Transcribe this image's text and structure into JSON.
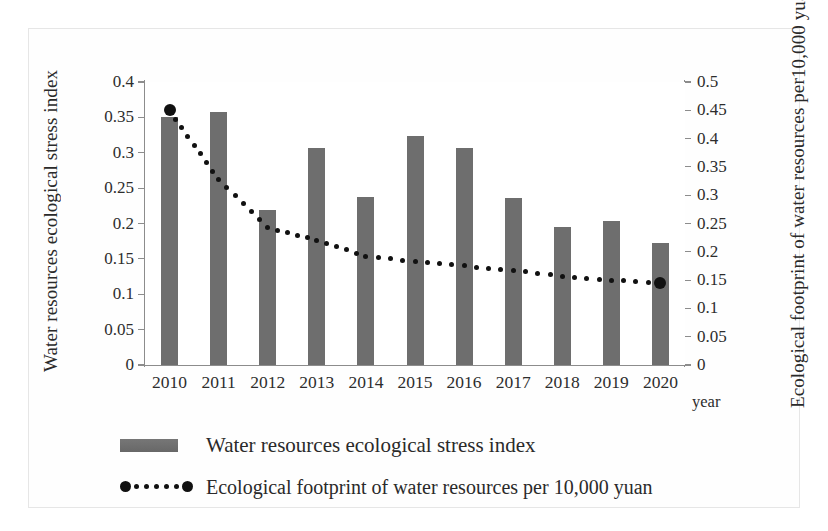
{
  "chart_data": {
    "type": "bar",
    "title": "",
    "xlabel": "year",
    "categories": [
      "2010",
      "2011",
      "2012",
      "2013",
      "2014",
      "2015",
      "2016",
      "2017",
      "2018",
      "2019",
      "2020"
    ],
    "series": [
      {
        "name": "Water resources ecological stress index",
        "type": "bar",
        "axis": "left",
        "color": "#6e6e6e",
        "values": [
          0.35,
          0.357,
          0.219,
          0.307,
          0.237,
          0.324,
          0.307,
          0.236,
          0.195,
          0.204,
          0.172
        ]
      },
      {
        "name": "Ecological footprint of water resources per 10,000 yuan",
        "type": "line",
        "axis": "right",
        "color": "#111111",
        "values": [
          0.45,
          0.327,
          0.243,
          0.22,
          0.192,
          0.183,
          0.175,
          0.167,
          0.157,
          0.15,
          0.145
        ]
      }
    ],
    "left_axis": {
      "title": "Water resources ecological stress index",
      "ticks": [
        "0",
        "0.05",
        "0.1",
        "0.15",
        "0.2",
        "0.25",
        "0.3",
        "0.35",
        "0.4"
      ],
      "min": 0,
      "max": 0.4,
      "step": 0.05
    },
    "right_axis": {
      "title_line1": "Ecological footprint of water resources per",
      "title_line2_pre": "10,000 yuan GDP/(hm",
      "title_line2_sup": "2",
      "title_line2_post": "/10,000 yuan)",
      "ticks": [
        "0",
        "0.05",
        "0.1",
        "0.15",
        "0.2",
        "0.25",
        "0.3",
        "0.35",
        "0.4",
        "0.45",
        "0.5"
      ],
      "min": 0,
      "max": 0.5,
      "step": 0.05
    },
    "grid": false,
    "legend_position": "bottom"
  },
  "legend": {
    "items": [
      {
        "label": "Water resources ecological stress index",
        "marker": "bar-swatch"
      },
      {
        "label": "Ecological footprint of water resources per 10,000 yuan",
        "marker": "dotted-line-swatch"
      }
    ]
  },
  "axis_titles": {
    "left": "Water resources ecological stress index",
    "bottom": "year"
  }
}
